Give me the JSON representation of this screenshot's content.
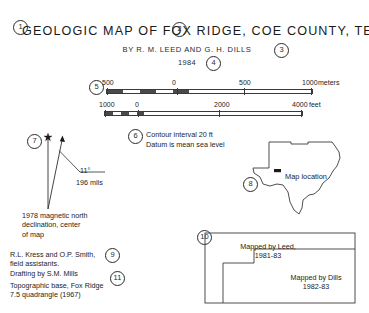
{
  "sheet": {
    "background": "#ffffff",
    "ink": "#1a1a1a"
  },
  "title_block": {
    "title": "GEOLOGIC  MAP  OF  FOX  RIDGE,  COE  COUNTY,  TEXAS",
    "authors": "BY  R. M. LEED  AND  G. H. DILLS",
    "year": "1984"
  },
  "callouts": {
    "n1": "1",
    "n2": "2",
    "n3": "3",
    "n4": "4",
    "n5": "5",
    "n6": "6",
    "n7": "7",
    "n8": "8",
    "n9": "9",
    "n10": "10",
    "n11": "11"
  },
  "scale_bars": [
    {
      "unit": "meters",
      "labels": [
        "500",
        "0",
        "500",
        "1000"
      ],
      "label_positions_pct": [
        0,
        34,
        67,
        100
      ],
      "divisions_dark_pct": [
        [
          0,
          8
        ],
        [
          16,
          24
        ],
        [
          32,
          40
        ]
      ],
      "tick_positions_pct": [
        0,
        34,
        67,
        100
      ]
    },
    {
      "unit": "feet",
      "labels": [
        "1000",
        "0",
        "2000",
        "4000"
      ],
      "label_positions_pct": [
        0,
        17,
        58,
        97
      ],
      "divisions_dark_pct": [
        [
          0,
          4
        ],
        [
          8,
          12
        ],
        [
          16,
          20
        ]
      ],
      "tick_positions_pct": [
        0,
        17,
        58,
        97
      ]
    }
  ],
  "contour_note": {
    "line1": "Contour interval 20 ft",
    "line2": "Datum is mean sea level"
  },
  "declination": {
    "angle": "11°",
    "mils": "196 mils",
    "note_line1": "1978 magnetic north",
    "note_line2": "declination, center",
    "note_line3": "of map"
  },
  "credits": {
    "assistants_line1": "R.L. Kress and O.P. Smith,",
    "assistants_line2": "field assistants.",
    "drafting": "Drafting by S.M. Mills",
    "base_line1": "Topographic base, Fox Ridge",
    "base_line2": "7.5 quadrangle (1967)"
  },
  "locator": {
    "state": "Texas",
    "map_location_label": "Map location"
  },
  "index_map": {
    "left_area_line1": "Mapped by Leed,",
    "left_area_line2": "1981-83",
    "right_area_line1": "Mapped by Dills",
    "right_area_line2": "1982-83"
  }
}
